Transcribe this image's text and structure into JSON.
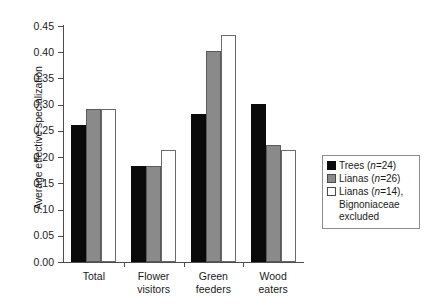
{
  "chart_data": {
    "type": "bar",
    "title": "",
    "xlabel": "",
    "ylabel": "Average effective specialization",
    "ylim": [
      0.0,
      0.45
    ],
    "ytick_labels": [
      "0.00",
      "0.05",
      "0.10",
      "0.15",
      "0.20",
      "0.25",
      "0.30",
      "0.35",
      "0.40",
      "0.45"
    ],
    "ytick_values": [
      0.0,
      0.05,
      0.1,
      0.15,
      0.2,
      0.25,
      0.3,
      0.35,
      0.4,
      0.45
    ],
    "grid": false,
    "legend_position": "right",
    "categories": [
      "Total",
      "Flower visitors",
      "Green feeders",
      "Wood eaters"
    ],
    "category_lines": [
      [
        "Total"
      ],
      [
        "Flower",
        "visitors"
      ],
      [
        "Green",
        "feeders"
      ],
      [
        "Wood",
        "eaters"
      ]
    ],
    "series": [
      {
        "name": "Trees (n=24)",
        "name_prefix": "Trees (",
        "name_italic": "n",
        "name_suffix": "=24)",
        "color": "#0a0a0a",
        "values": [
          0.262,
          0.183,
          0.283,
          0.301
        ]
      },
      {
        "name": "Lianas (n=26)",
        "name_prefix": "Lianas (",
        "name_italic": "n",
        "name_suffix": "=26)",
        "color": "#8a8a8a",
        "values": [
          0.292,
          0.183,
          0.403,
          0.224
        ]
      },
      {
        "name": "Lianas (n=14), Bignoniaceae excluded",
        "name_prefix": "Lianas (",
        "name_italic": "n",
        "name_suffix": "=14),",
        "name_continuation": [
          "Bignoniaceae",
          "excluded"
        ],
        "color": "#ffffff",
        "values": [
          0.292,
          0.213,
          0.432,
          0.213
        ]
      }
    ]
  }
}
